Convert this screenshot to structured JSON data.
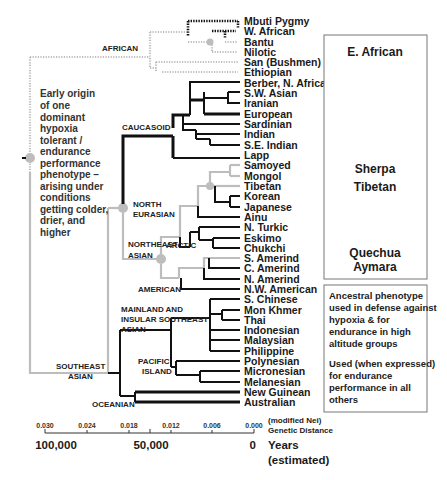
{
  "tree": {
    "leaves": [
      {
        "label": "Mbuti Pygmy",
        "y": 21
      },
      {
        "label": "W. African",
        "y": 31
      },
      {
        "label": "Bantu",
        "y": 42
      },
      {
        "label": "Nilotic",
        "y": 52
      },
      {
        "label": "San (Bushmen)",
        "y": 62
      },
      {
        "label": "Ethiopian",
        "y": 72
      },
      {
        "label": "Berber, N. African",
        "y": 83
      },
      {
        "label": "S.W. Asian",
        "y": 93
      },
      {
        "label": "Iranian",
        "y": 103
      },
      {
        "label": "European",
        "y": 114
      },
      {
        "label": "Sardinian",
        "y": 124
      },
      {
        "label": "Indian",
        "y": 134
      },
      {
        "label": "S.E. Indian",
        "y": 145
      },
      {
        "label": "Lapp",
        "y": 155
      },
      {
        "label": "Samoyed",
        "y": 165
      },
      {
        "label": "Mongol",
        "y": 176
      },
      {
        "label": "Tibetan",
        "y": 186
      },
      {
        "label": "Korean",
        "y": 196
      },
      {
        "label": "Japanese",
        "y": 207
      },
      {
        "label": "Ainu",
        "y": 217
      },
      {
        "label": "N. Turkic",
        "y": 227
      },
      {
        "label": "Eskimo",
        "y": 238
      },
      {
        "label": "Chukchi",
        "y": 248
      },
      {
        "label": "S. Amerind",
        "y": 258
      },
      {
        "label": "C. Amerind",
        "y": 268
      },
      {
        "label": "N. Amerind",
        "y": 279
      },
      {
        "label": "N.W. American",
        "y": 289
      },
      {
        "label": "S. Chinese",
        "y": 299
      },
      {
        "label": "Mon Khmer",
        "y": 310
      },
      {
        "label": "Thai",
        "y": 320
      },
      {
        "label": "Indonesian",
        "y": 330
      },
      {
        "label": "Malaysian",
        "y": 340
      },
      {
        "label": "Philippine",
        "y": 351
      },
      {
        "label": "Polynesian",
        "y": 361
      },
      {
        "label": "Micronesian",
        "y": 371
      },
      {
        "label": "Melanesian",
        "y": 382
      },
      {
        "label": "New Guinean",
        "y": 392
      },
      {
        "label": "Australian",
        "y": 402
      }
    ],
    "clades": {
      "african": "AFRICAN",
      "caucasoid": "CAUCASOID",
      "north_eurasian_1": "NORTH",
      "north_eurasian_2": "EURASIAN",
      "northeast_asian_1": "NORTHEAST",
      "northeast_asian_2": "ASIAN",
      "arctic": "ARCTIC",
      "american": "AMERICAN",
      "mainland_1": "MAINLAND AND",
      "mainland_2": "INSULAR SOUTHEAST",
      "mainland_3": "ASIAN",
      "pacific_1": "PACIFIC",
      "pacific_2": "ISLAND",
      "southeast_asian_1": "SOUTHEAST",
      "southeast_asian_2": "ASIAN",
      "oceanian": "OCEANIAN"
    },
    "annotation": [
      "Early origin",
      "of one",
      "dominant",
      "hypoxia",
      "tolerant /",
      "endurance",
      "performance",
      "phenotype –",
      "arising under",
      "conditions",
      "getting colder,",
      "drier, and",
      "higher"
    ]
  },
  "highland_box": {
    "groups": [
      {
        "lines": [
          "E. African"
        ]
      },
      {
        "lines": [
          "Sherpa",
          "Tibetan"
        ]
      },
      {
        "lines": [
          "Quechua",
          "Aymara"
        ]
      }
    ]
  },
  "legend_box": {
    "paragraph1": [
      "Ancestral phenotype",
      "used in defense against",
      "hypoxia & for",
      "endurance in high",
      "altitude groups"
    ],
    "paragraph2": [
      "Used (when expressed)",
      "for endurance",
      "performance in all",
      "others"
    ]
  },
  "axis": {
    "ticks": [
      "0.030",
      "0.024",
      "0.018",
      "0.012",
      "0.006",
      "0.000"
    ],
    "label_1": "(modified Nei)",
    "label_2": "Genetic Distance",
    "years": [
      "100,000",
      "50,000",
      "0"
    ],
    "years_label_1": "Years",
    "years_label_2": "(estimated)"
  },
  "colors": {
    "ancestral_gray": "#bdbdbd",
    "lineage_black": "#111111"
  }
}
